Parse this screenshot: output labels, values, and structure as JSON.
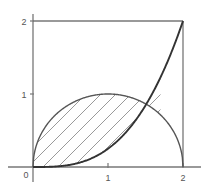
{
  "chart_data": {
    "type": "line",
    "title": "",
    "subtitle": "",
    "xlabel": "",
    "ylabel": "",
    "xlim": [
      0,
      2
    ],
    "ylim": [
      0,
      2
    ],
    "grid": false,
    "legend": null,
    "x_ticks": [
      {
        "value": 0,
        "label": "0"
      },
      {
        "value": 1,
        "label": "1"
      },
      {
        "value": 2,
        "label": "2"
      }
    ],
    "y_ticks": [
      {
        "value": 1,
        "label": "1"
      },
      {
        "value": 2,
        "label": "2"
      }
    ],
    "origin_label": "0",
    "series": [
      {
        "name": "semicircle",
        "equation": "y = sqrt(1 - (x - 1)^2)",
        "color": "#555555",
        "x": [
          0.0,
          0.1,
          0.2,
          0.3,
          0.4,
          0.5,
          0.6,
          0.7,
          0.8,
          0.9,
          1.0,
          1.1,
          1.2,
          1.3,
          1.4,
          1.5,
          1.6,
          1.7,
          1.8,
          1.9,
          2.0
        ],
        "values": [
          0.0,
          0.436,
          0.6,
          0.714,
          0.8,
          0.866,
          0.917,
          0.954,
          0.98,
          0.995,
          1.0,
          0.995,
          0.98,
          0.954,
          0.917,
          0.866,
          0.8,
          0.714,
          0.6,
          0.436,
          0.0
        ]
      },
      {
        "name": "cubic",
        "equation": "y = x^3 / 4",
        "color": "#333333",
        "x": [
          0.0,
          0.1,
          0.2,
          0.3,
          0.4,
          0.5,
          0.6,
          0.7,
          0.8,
          0.9,
          1.0,
          1.1,
          1.2,
          1.3,
          1.4,
          1.5,
          1.6,
          1.7,
          1.8,
          1.9,
          2.0
        ],
        "values": [
          0.0,
          0.00025,
          0.002,
          0.00675,
          0.016,
          0.03125,
          0.054,
          0.08575,
          0.128,
          0.18225,
          0.25,
          0.33275,
          0.432,
          0.54925,
          0.686,
          0.84375,
          1.024,
          1.22825,
          1.458,
          1.71475,
          2.0
        ]
      }
    ],
    "shaded_region": {
      "name": "hatched-area",
      "between": [
        "semicircle",
        "cubic"
      ],
      "x_start": 0.0,
      "x_end": 1.7,
      "hatch_pattern": "diagonal-45",
      "hatch_color": "#999999",
      "hatch_spacing": 0.2
    },
    "box": {
      "top_line_y": 2,
      "right_line_x": 2,
      "color": "#777777"
    },
    "axis_color": "#777777",
    "background": "#ffffff"
  }
}
